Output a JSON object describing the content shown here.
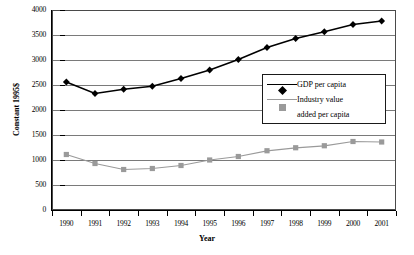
{
  "chart_data": {
    "type": "line",
    "title": "",
    "xlabel": "Year",
    "ylabel": "Constant 1995$",
    "categories": [
      "1990",
      "1991",
      "1992",
      "1993",
      "1994",
      "1995",
      "1996",
      "1997",
      "1998",
      "1999",
      "2000",
      "2001"
    ],
    "ylim": [
      0,
      4000
    ],
    "yticks": [
      0,
      500,
      1000,
      1500,
      2000,
      2500,
      3000,
      3500,
      4000
    ],
    "ytick_labels": [
      "0",
      "500",
      "1000",
      "1500",
      "2000",
      "2500",
      "3000",
      "3500",
      "4000"
    ],
    "grid": true,
    "legend_position": "center-right-inside",
    "series": [
      {
        "name": "GDP per capita",
        "marker": "diamond",
        "color": "#000000",
        "values": [
          2560,
          2330,
          2415,
          2475,
          2630,
          2800,
          3010,
          3250,
          3430,
          3565,
          3710,
          3780
        ]
      },
      {
        "name": "Industry value added per capita",
        "marker": "square",
        "color": "#9a9a9a",
        "values": [
          1110,
          930,
          810,
          830,
          890,
          1000,
          1070,
          1185,
          1245,
          1285,
          1370,
          1360
        ]
      }
    ]
  },
  "legend": {
    "entries": [
      {
        "label_line1": "GDP per capita",
        "label_line2": ""
      },
      {
        "label_line1": "Industry value",
        "label_line2": "added per capita"
      }
    ]
  },
  "axes": {
    "x_title": "Year",
    "y_title": "Constant 1995$"
  },
  "colors": {
    "series_gdp": "#000000",
    "series_industry": "#9a9a9a",
    "gridline": "#7a7a7a",
    "axis": "#000000",
    "plot_border": "#4a4a4a",
    "background": "#ffffff"
  }
}
